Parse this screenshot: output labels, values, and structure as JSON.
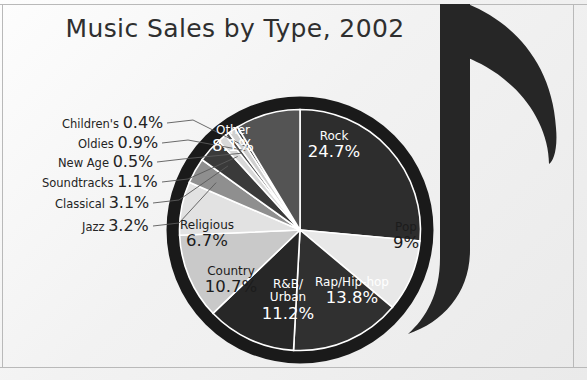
{
  "figure": {
    "title": "Music Sales by Type, 2002",
    "background_color": "#f2f2f2",
    "border_color": "#b9b9b9",
    "note_color": "#262626",
    "pie_ring_color": "#1a1a1a"
  },
  "chart_data": {
    "type": "pie",
    "title": "Music Sales by Type, 2002",
    "xlabel": "",
    "ylabel": "",
    "units": "percent",
    "legend": "none (labels on slices and leader lines)",
    "grid": false,
    "categories": [
      "Rock",
      "Pop",
      "Rap/Hip-hop",
      "R&B/Urban",
      "Country",
      "Religious",
      "Jazz",
      "Classical",
      "Soundtracks",
      "New Age",
      "Oldies",
      "Children's",
      "Other"
    ],
    "values": [
      24.7,
      9,
      13.8,
      11.2,
      10.7,
      6.7,
      3.2,
      3.1,
      1.1,
      0.5,
      0.9,
      0.4,
      8.1
    ],
    "labels": [
      "24.7%",
      "9%",
      "13.8%",
      "11.2%",
      "10.7%",
      "6.7%",
      "3.2%",
      "3.1%",
      "1.1%",
      "0.5%",
      "0.9%",
      "0.4%",
      "8.1%"
    ],
    "colors": [
      "#2d2d2d",
      "#e8e8e8",
      "#303030",
      "#272727",
      "#c9c9c9",
      "#e2e2e2",
      "#8f8f8f",
      "#3a3a3a",
      "#d8d8d8",
      "#4a4a4a",
      "#cfcfcf",
      "#3f3f3f",
      "#545454"
    ]
  },
  "slice_labels": [
    {
      "name": "Other",
      "value": "8.1%",
      "tone": "light",
      "x": 233,
      "y": 140
    },
    {
      "name": "Rock",
      "value": "24.7%",
      "tone": "light",
      "x": 334,
      "y": 146
    },
    {
      "name": "Pop",
      "value": "9%",
      "tone": "dark",
      "x": 406,
      "y": 237
    },
    {
      "name": "Rap/Hip-hop",
      "value": "13.8%",
      "tone": "light",
      "x": 352,
      "y": 292
    },
    {
      "name": "R&B/\nUrban",
      "value": "11.2%",
      "tone": "light",
      "x": 288,
      "y": 301
    },
    {
      "name": "Country",
      "value": "10.7%",
      "tone": "dark",
      "x": 231,
      "y": 281
    },
    {
      "name": "Religious",
      "value": "6.7%",
      "tone": "dark",
      "x": 207,
      "y": 235
    }
  ],
  "leader_labels": [
    {
      "name": "Children's",
      "value": "0.4%",
      "x": 62,
      "y": 113
    },
    {
      "name": "Oldies",
      "value": "0.9%",
      "x": 78,
      "y": 133
    },
    {
      "name": "New Age",
      "value": "0.5%",
      "x": 58,
      "y": 152
    },
    {
      "name": "Soundtracks",
      "value": "1.1%",
      "x": 42,
      "y": 172
    },
    {
      "name": "Classical",
      "value": "3.1%",
      "x": 55,
      "y": 193
    },
    {
      "name": "Jazz",
      "value": "3.2%",
      "x": 82,
      "y": 216
    }
  ]
}
